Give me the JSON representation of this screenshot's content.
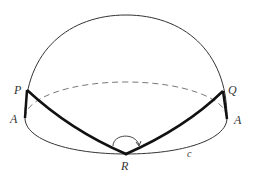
{
  "diagram": {
    "type": "hemisphere-geodesic",
    "labels": {
      "P": "P",
      "Q": "Q",
      "A_left": "A",
      "A_right": "A",
      "R": "R",
      "c": "c"
    },
    "colors": {
      "stroke": "#333333",
      "thick": "#111111",
      "dashed": "#555555",
      "background": "#ffffff"
    }
  }
}
